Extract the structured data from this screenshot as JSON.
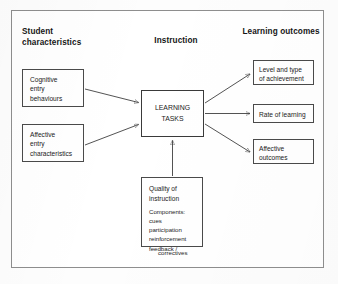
{
  "figure": {
    "kind": "flow-diagram",
    "caption_present": false
  },
  "headings": {
    "student": "Student\ncharacteristics",
    "instruction": "Instruction",
    "outcomes": "Learning\noutcomes"
  },
  "nodes": {
    "cognitive_entry": "Cognitive\nentry\nbehaviours",
    "affective_entry": "Affective\nentry\ncharacteristics",
    "learning_tasks": "LEARNING\nTASKS",
    "quality_title": "Quality of\ninstruction",
    "quality_components": "Components:\ncues\nparticipation\nreinforcement\nfeedback /",
    "quality_components_tail": "correctives",
    "level_and_type": "Level and type\nof achievement",
    "rate_of_learning": "Rate of learning",
    "affective_outcomes": "Affective\noutcomes"
  },
  "edges": [
    {
      "name": "cognitive-entry-to-learning-tasks",
      "from": "cognitive_entry",
      "to": "learning_tasks",
      "arrow": "end"
    },
    {
      "name": "affective-entry-to-learning-tasks",
      "from": "affective_entry",
      "to": "learning_tasks",
      "arrow": "end"
    },
    {
      "name": "quality-to-learning-tasks",
      "from": "quality_title",
      "to": "learning_tasks",
      "arrow": "end"
    },
    {
      "name": "learning-tasks-to-level-and-type",
      "from": "learning_tasks",
      "to": "level_and_type",
      "arrow": "end"
    },
    {
      "name": "learning-tasks-to-rate-of-learning",
      "from": "learning_tasks",
      "to": "rate_of_learning",
      "arrow": "end"
    },
    {
      "name": "learning-tasks-to-affective-outcomes",
      "from": "learning_tasks",
      "to": "affective_outcomes",
      "arrow": "end"
    }
  ],
  "style": {
    "page_background": "#fdfdfd",
    "frame_border": "#8e8e8e",
    "box_border": "#4a4a4a",
    "connector_stroke": "#3f3f3f",
    "text_color": "#1b1b1b"
  }
}
